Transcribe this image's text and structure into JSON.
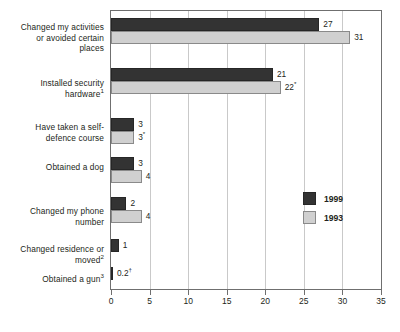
{
  "chart_data": {
    "type": "bar",
    "orientation": "horizontal",
    "title": "",
    "subtitle": "",
    "xlabel": "",
    "ylabel": "",
    "xlim": [
      0,
      35
    ],
    "xticks": [
      0,
      5,
      10,
      15,
      20,
      25,
      30,
      35
    ],
    "xticklabels": [
      "0",
      "5",
      "10",
      "15",
      "20",
      "25",
      "30",
      "35"
    ],
    "grid": true,
    "grid_axis": "x",
    "legend_position": "center-right",
    "categories": [
      "Changed my activities or avoided certain places",
      "Installed security hardware¹",
      "Have taken a self-defence course",
      "Obtained a dog",
      "Changed my phone number",
      "Changed residence or moved²",
      "Obtained a gun³"
    ],
    "series": [
      {
        "name": "1999",
        "color": "#333333",
        "values": [
          27,
          21,
          3,
          3,
          2,
          1,
          0.2
        ],
        "labels": [
          "27",
          "21",
          "3",
          "3",
          "2",
          "1",
          "0.2†"
        ]
      },
      {
        "name": "1993",
        "color": "#d0d0d0",
        "values": [
          31,
          22,
          3,
          4,
          4,
          null,
          null
        ],
        "labels": [
          "31",
          "22*",
          "3*",
          "4",
          "4",
          "",
          ""
        ]
      }
    ]
  },
  "categories_display": [
    {
      "lines": [
        "Changed my activities",
        "or avoided certain",
        "places"
      ],
      "sup": ""
    },
    {
      "lines": [
        "Installed security",
        "hardware"
      ],
      "sup": "1"
    },
    {
      "lines": [
        "Have taken a self-",
        "defence course"
      ],
      "sup": ""
    },
    {
      "lines": [
        "Obtained a dog"
      ],
      "sup": ""
    },
    {
      "lines": [
        "Changed my phone",
        "number"
      ],
      "sup": ""
    },
    {
      "lines": [
        "Changed residence or",
        "moved"
      ],
      "sup": "2"
    },
    {
      "lines": [
        "Obtained a gun"
      ],
      "sup": "3"
    }
  ],
  "legend": {
    "items": [
      {
        "label": "1999",
        "color": "#333333"
      },
      {
        "label": "1993",
        "color": "#d0d0d0"
      }
    ]
  },
  "axis": {
    "x_ticklabels": [
      "0",
      "5",
      "10",
      "15",
      "20",
      "25",
      "30",
      "35"
    ]
  },
  "colors": {
    "series_1999": "#333333",
    "series_1993": "#d0d0d0",
    "frame": "#6f6f6f",
    "grid": "#c9c9c9",
    "text": "#231f20",
    "background": "#ffffff"
  }
}
